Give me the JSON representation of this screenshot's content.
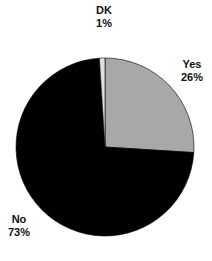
{
  "chart_data": {
    "type": "pie",
    "title": "",
    "categories": [
      "Yes",
      "No",
      "DK"
    ],
    "values": [
      26,
      73,
      1
    ],
    "labels": [
      "26%",
      "73%",
      "1%"
    ],
    "colors": [
      "#a8a8a8",
      "#000000",
      "#e0e0e0"
    ],
    "start_angle_deg": 90,
    "direction": "clockwise",
    "legend": "none (slice labels outside)"
  },
  "labels": {
    "dk": {
      "name": "DK",
      "pct": "1%"
    },
    "yes": {
      "name": "Yes",
      "pct": "26%"
    },
    "no": {
      "name": "No",
      "pct": "73%"
    }
  }
}
